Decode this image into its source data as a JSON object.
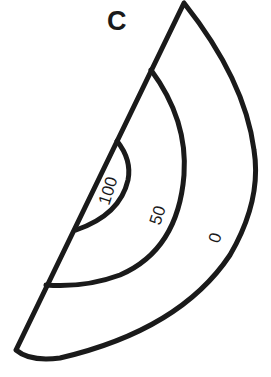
{
  "diagram": {
    "title_label": "C",
    "zones": [
      {
        "label": "100",
        "desc": "innermost region"
      },
      {
        "label": "50",
        "desc": "middle region"
      },
      {
        "label": "0",
        "desc": "outer region"
      }
    ],
    "colors": {
      "stroke": "#1a1a1a",
      "background": "#ffffff"
    }
  }
}
